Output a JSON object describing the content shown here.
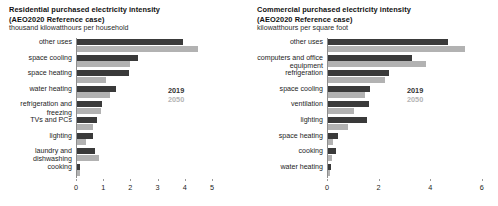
{
  "chart_data": [
    {
      "type": "bar",
      "orientation": "horizontal",
      "title": "Residential purchased electricity intensity",
      "subtitle": "(AEO2020 Reference case)",
      "ylabel": "thousand kilowatthours per household",
      "xlabel": "",
      "categories": [
        "other uses",
        "space cooling",
        "space heating",
        "water heating",
        "refrigeration and freezing",
        "TVs and PCs",
        "lighting",
        "laundry and dishwashing",
        "cooking"
      ],
      "series": [
        {
          "name": "2019",
          "color": "#3a3a3a",
          "values": [
            3.9,
            2.25,
            1.9,
            1.45,
            0.92,
            0.72,
            0.6,
            0.68,
            0.12
          ]
        },
        {
          "name": "2050",
          "color": "#b2b2b2",
          "values": [
            4.45,
            1.95,
            1.05,
            1.22,
            0.88,
            0.6,
            0.33,
            0.82,
            0.1
          ]
        }
      ],
      "xlim": [
        0,
        5
      ],
      "xticks": [
        0,
        1,
        2,
        3,
        4,
        5
      ],
      "xticklabels": [
        "0",
        "1",
        "2",
        "3",
        "4",
        "5"
      ],
      "grid": false,
      "legend_position": "inside-right"
    },
    {
      "type": "bar",
      "orientation": "horizontal",
      "title": "Commercial purchased electricity intensity",
      "subtitle": "(AEO2020 Reference case)",
      "ylabel": "kilowatthours per square foot",
      "xlabel": "",
      "categories": [
        "other uses",
        "computers and office equipment",
        "refrigeration",
        "space cooling",
        "ventilation",
        "lighting",
        "space heating",
        "cooking",
        "water heating"
      ],
      "series": [
        {
          "name": "2019",
          "color": "#3a3a3a",
          "values": [
            4.65,
            3.25,
            2.35,
            1.62,
            1.6,
            1.52,
            0.38,
            0.32,
            0.1
          ]
        },
        {
          "name": "2050",
          "color": "#b2b2b2",
          "values": [
            5.3,
            3.8,
            2.2,
            1.45,
            1.02,
            0.78,
            0.18,
            0.17,
            0.08
          ]
        }
      ],
      "xlim": [
        0,
        6
      ],
      "xticks": [
        0,
        2,
        4,
        6
      ],
      "xticklabels": [
        "0",
        "2",
        "4",
        "6"
      ],
      "grid": false,
      "legend_position": "inside-right"
    }
  ]
}
